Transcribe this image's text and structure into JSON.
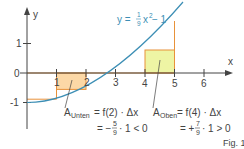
{
  "figure": {
    "caption": "Fig. 1",
    "axes": {
      "x_label": "x",
      "y_label": "y",
      "origin_label": "0",
      "x_ticks": [
        "1",
        "2",
        "3",
        "4",
        "5",
        "6"
      ],
      "y_ticks": [
        "1",
        "-1"
      ]
    },
    "curve": {
      "label_prefix": "y = ",
      "label_num": "1",
      "label_den": "9",
      "label_suffix": "x",
      "label_exp": "2",
      "label_tail": " − 1",
      "color": "#3d8fb5"
    },
    "lower_rect": {
      "label_main": "A",
      "label_sub": "Unten",
      "formula": " = f(2) · Δx",
      "line2_prefix": "= −",
      "line2_num": "5",
      "line2_den": "9",
      "line2_suffix": "· 1 < 0",
      "fill": "#fcd8a6",
      "stroke": "#e8923a"
    },
    "upper_rect": {
      "label_main": "A",
      "label_sub": "Oben",
      "formula": " = f(4) · Δx",
      "line2_prefix": "= +",
      "line2_num": "7",
      "line2_den": "9",
      "line2_suffix": "· 1 > 0",
      "fill": "#eef5a4",
      "stroke": "#e8923a"
    }
  }
}
